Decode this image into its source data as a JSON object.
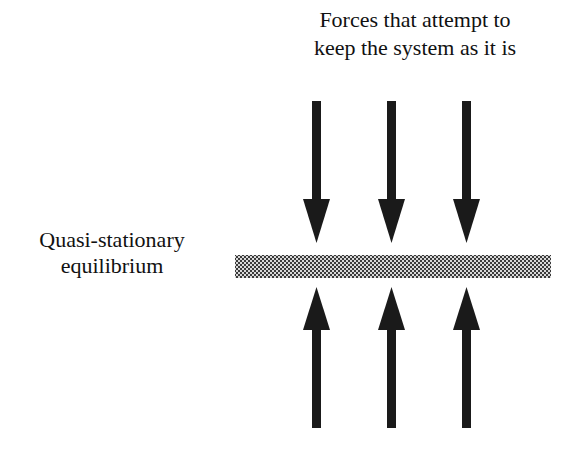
{
  "diagram": {
    "title_line1": "Forces that attempt to",
    "title_line2": "keep the system as it is",
    "equilibrium_label_line1": "Quasi-stationary",
    "equilibrium_label_line2": "equilibrium",
    "arrows_down_count": 3,
    "arrows_up_count": 3,
    "colors": {
      "arrow": "#1a1a1a",
      "bar_dark": "#3a3a3a",
      "bar_light": "#d8d8d8",
      "background": "#ffffff"
    }
  }
}
